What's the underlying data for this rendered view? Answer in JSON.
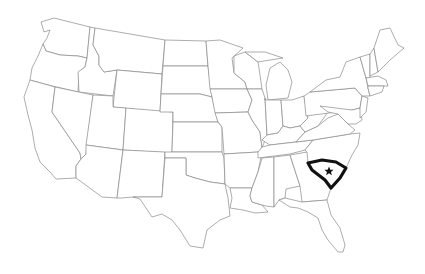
{
  "map": {
    "title": "United States",
    "highlighted_state": "South Carolina",
    "highlight_color": "#111111",
    "border_color": "#8a8a8a",
    "background": "#ffffff",
    "capital_marker": "star-icon"
  }
}
